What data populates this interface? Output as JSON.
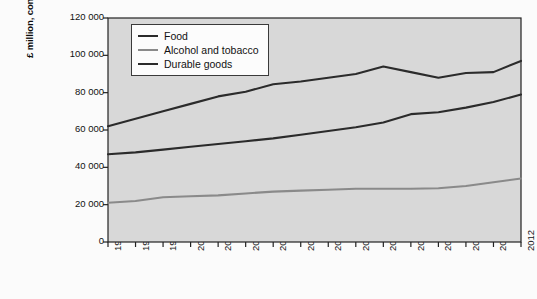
{
  "chart_data": {
    "type": "line",
    "title": "",
    "xlabel": "",
    "ylabel": "£ million, constant prices",
    "x": [
      1997,
      1998,
      1999,
      2000,
      2001,
      2002,
      2003,
      2004,
      2005,
      2006,
      2007,
      2008,
      2009,
      2010,
      2011,
      2012
    ],
    "xtick_labels": [
      "1997",
      "1998",
      "1999",
      "2000",
      "2001",
      "2002",
      "2003",
      "2004",
      "2005",
      "2006",
      "2007",
      "2008",
      "2009",
      "2010",
      "2011",
      "2012"
    ],
    "ylim": [
      0,
      120000
    ],
    "ytick_values": [
      0,
      20000,
      40000,
      60000,
      80000,
      100000,
      120000
    ],
    "ytick_labels": [
      "0",
      "20 000",
      "40 000",
      "60 000",
      "80 000",
      "100 000",
      "120 000"
    ],
    "grid": false,
    "legend_position": "top-left",
    "series": [
      {
        "name": "Food",
        "color": "#2b2b2b",
        "values": [
          62000,
          66000,
          70000,
          74000,
          78000,
          80500,
          84500,
          86000,
          88000,
          90000,
          94000,
          91000,
          88000,
          90500,
          91000,
          97000
        ]
      },
      {
        "name": "Alcohol and tobacco",
        "color": "#8a8a8a",
        "values": [
          21000,
          22000,
          24000,
          24500,
          25000,
          26000,
          27000,
          27500,
          28000,
          28500,
          28500,
          28500,
          28800,
          30000,
          32000,
          34000
        ]
      },
      {
        "name": "Durable goods",
        "color": "#2b2b2b",
        "values": [
          47000,
          48000,
          49500,
          51000,
          52500,
          54000,
          55500,
          57500,
          59500,
          61500,
          64000,
          68500,
          69500,
          72000,
          75000,
          79000
        ]
      }
    ]
  },
  "legend": {
    "items": [
      {
        "label": "Food",
        "color": "#2b2b2b"
      },
      {
        "label": "Alcohol and tobacco",
        "color": "#8a8a8a"
      },
      {
        "label": "Durable goods",
        "color": "#2b2b2b"
      }
    ]
  },
  "plot_style": {
    "plot_background": "#d8d8d8",
    "page_background": "#fbfbfb",
    "axis_color": "#222222"
  }
}
